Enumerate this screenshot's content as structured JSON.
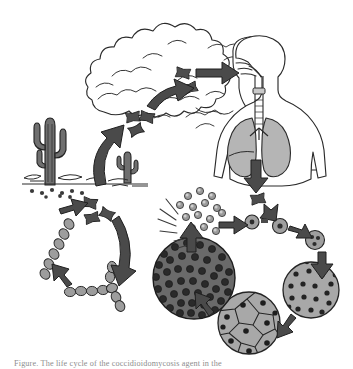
{
  "figure": {
    "caption": "Figure. The life cycle of the coccidioidomycosis agent in the",
    "background_color": "#ffffff",
    "ink_color": "#1a1a1a",
    "arrow_color": "#4a4a4a",
    "spore_fill": "#8f8f8f",
    "lung_fill": "#b5b5b5",
    "spherule_fill": "#a8a8a8",
    "mature_spherule_fill": "#6a6a6a",
    "cactus_fill": "#6f6f6f"
  },
  "stages": {
    "environment": {
      "label": "Desert soil environment",
      "cactus_large": "saguaro-cactus",
      "cactus_small": "small-cactus",
      "ground_line": "desert-ground",
      "soil_spores": "arthroconidia-in-soil"
    },
    "dust_cloud": {
      "label": "Airborne dust cloud",
      "icon": "dust-cloud"
    },
    "airborne_arthroconidia": {
      "label": "Airborne arthroconidia",
      "count_upper": 3,
      "count_inhaled": 2
    },
    "host": {
      "label": "Human host inhalation",
      "torso": "human-torso",
      "airway": "trachea",
      "lungs": "lungs"
    },
    "saprobic_cycle": {
      "label": "Saprobic (soil) cycle",
      "hyphae": "septate-hyphae",
      "arthroconidia_chain": "arthroconidia-chain",
      "branching_hyphae": "branching-hyphae"
    },
    "parasitic_cycle": {
      "label": "Parasitic (host tissue) cycle",
      "steps": [
        {
          "name": "arthroconidium-in-lung",
          "caption": "inhaled arthroconidium"
        },
        {
          "name": "young-spherule",
          "caption": "rounding spherule"
        },
        {
          "name": "enlarging-spherule",
          "caption": "enlarging spherule"
        },
        {
          "name": "early-endospore-spherule",
          "caption": "spherule with endospores"
        },
        {
          "name": "maturing-spherule",
          "caption": "maturing spherule"
        },
        {
          "name": "segmenting-spherule",
          "caption": "segmenting spherule"
        },
        {
          "name": "mature-spherule",
          "caption": "mature spherule packed with endospores"
        },
        {
          "name": "ruptured-spherule",
          "caption": "rupture and endospore release"
        }
      ]
    },
    "endospore_release": {
      "label": "Released endospores",
      "burst_icon": "burst-lines",
      "endospore_count": 14
    }
  },
  "arrows": [
    {
      "name": "arrow-soil-to-air",
      "from": "desert-soil",
      "to": "dust-cloud"
    },
    {
      "name": "arrow-cloud-to-airborne",
      "from": "dust-cloud",
      "to": "airborne-arthroconidia"
    },
    {
      "name": "arrow-airborne-to-host",
      "from": "airborne-arthroconidia",
      "to": "human-host"
    },
    {
      "name": "arrow-host-to-lung-spore",
      "from": "lungs",
      "to": "arthroconidium-in-lung"
    },
    {
      "name": "arrow-spore-to-spherule",
      "from": "arthroconidium-in-lung",
      "to": "young-spherule"
    },
    {
      "name": "arrow-spherule-growth",
      "from": "young-spherule",
      "to": "enlarging-spherule"
    },
    {
      "name": "arrow-spherule-to-mature",
      "from": "enlarging-spherule",
      "to": "maturing-spherule"
    },
    {
      "name": "arrow-mature-to-segmenting",
      "from": "maturing-spherule",
      "to": "segmenting-spherule"
    },
    {
      "name": "arrow-segmenting-to-packed",
      "from": "segmenting-spherule",
      "to": "mature-spherule"
    },
    {
      "name": "arrow-rupture-to-endospores",
      "from": "mature-spherule",
      "to": "released-endospores"
    },
    {
      "name": "arrow-endospores-to-new-spherule",
      "from": "released-endospores",
      "to": "young-spherule"
    },
    {
      "name": "arrow-soil-spores-to-hyphae",
      "from": "soil-arthroconidia",
      "to": "hyphae"
    },
    {
      "name": "arrow-hyphae-to-chain",
      "from": "hyphae",
      "to": "arthroconidia-chain"
    },
    {
      "name": "arrow-chain-to-branching",
      "from": "arthroconidia-chain",
      "to": "branching-hyphae"
    },
    {
      "name": "arrow-branching-to-arthroconidia",
      "from": "branching-hyphae",
      "to": "soil-arthroconidia"
    }
  ]
}
